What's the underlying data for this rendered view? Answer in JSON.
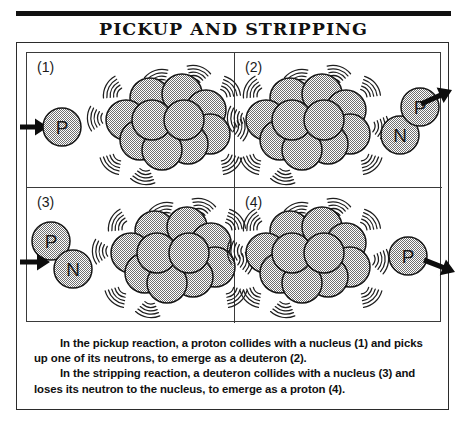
{
  "figure": {
    "title": "PICKUP AND STRIPPING",
    "caption": {
      "paragraph_1": "In the pickup reaction, a proton collides with a nucleus (1) and picks up one of its neutrons, to emerge as a deuteron (2).",
      "paragraph_2": "In the stripping reaction, a deuteron collides with a nucleus (3) and loses its neutron to the nucleus, to emerge as a proton (4)."
    },
    "colors": {
      "ink": "#111111",
      "frame": "#2b2b2b",
      "grid_line": "#3a3a3a",
      "nucleon_fill": "#9a9a9a",
      "nucleon_stroke": "#151515",
      "arrow": "#0d0d0d",
      "background": "#ffffff"
    },
    "panels": [
      {
        "number": "(1)",
        "label": "panel-1-pickup-before",
        "incoming_particle": "P",
        "incoming_particle_name": "proton",
        "arrow_direction": "right",
        "arrow_position": "left-edge",
        "nucleus": "target-nucleus",
        "outgoing_particle": null
      },
      {
        "number": "(2)",
        "label": "panel-2-pickup-after",
        "incoming_particle": null,
        "arrow_direction": "up-right",
        "arrow_position": "right-edge",
        "nucleus": "target-nucleus",
        "outgoing_particle": "deuteron",
        "outgoing_nucleons": [
          "N",
          "P"
        ]
      },
      {
        "number": "(3)",
        "label": "panel-3-stripping-before",
        "incoming_particle": "deuteron",
        "incoming_nucleons": [
          "P",
          "N"
        ],
        "arrow_direction": "right",
        "arrow_position": "left-edge",
        "nucleus": "target-nucleus",
        "outgoing_particle": null
      },
      {
        "number": "(4)",
        "label": "panel-4-stripping-after",
        "incoming_particle": null,
        "arrow_direction": "right",
        "arrow_position": "right-edge",
        "nucleus": "target-nucleus",
        "outgoing_particle": "P",
        "outgoing_particle_name": "proton"
      }
    ],
    "nucleon_labels": {
      "proton": "P",
      "neutron": "N"
    }
  }
}
